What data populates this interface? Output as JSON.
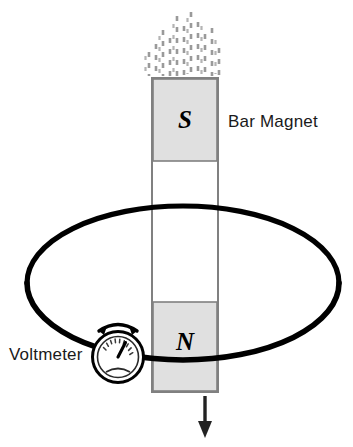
{
  "diagram": {
    "labels": {
      "bar_magnet": "Bar Magnet",
      "voltmeter": "Voltmeter"
    },
    "magnet": {
      "south_pole_letter": "S",
      "north_pole_letter": "N",
      "pole_fill_color": "#e0e0e0",
      "body_fill_color": "#ffffff",
      "outline_color": "#808080",
      "geometry": {
        "x": 152,
        "y": 78,
        "width": 66,
        "height": 314,
        "south_pole_height": 83,
        "north_pole_top": 302,
        "north_pole_height": 90
      }
    },
    "field_lines": {
      "name": "magnetic-field-lines",
      "style": "dashed",
      "color": "#9a9a9a",
      "count": 11,
      "top": 8,
      "bottom": 76
    },
    "loop": {
      "name": "conducting-wire-loop",
      "shape": "ellipse",
      "color": "#000000",
      "stroke_width": 5,
      "center_x": 183,
      "center_y": 283,
      "radius_x": 156,
      "radius_y": 77
    },
    "voltmeter": {
      "name": "voltmeter-gauge",
      "center_x": 118,
      "center_y": 357,
      "outer_radius": 25,
      "dial_radius": 20,
      "tick_count": 11,
      "needle_angle_deg": -72,
      "deflection_arrow": {
        "label": "needle-deflection-arc",
        "double_headed": true
      }
    },
    "motion_arrow": {
      "name": "magnet-motion-arrow",
      "direction": "down",
      "color": "#222222",
      "x": 205,
      "from_y": 396,
      "to_y": 438
    },
    "colors": {
      "ink": "#000000",
      "pole_gray": "#e0e0e0",
      "field_gray": "#9a9a9a",
      "outline_gray": "#808080"
    }
  }
}
